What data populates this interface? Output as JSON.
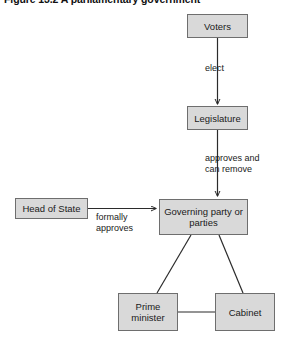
{
  "figure": {
    "title": "Figure 13.2  A parliamentary government",
    "nodes": {
      "voters": "Voters",
      "legislature": "Legislature",
      "head_of_state": "Head of State",
      "governing_party": "Governing party\nor parties",
      "prime_minister": "Prime\nminister",
      "cabinet": "Cabinet"
    },
    "edge_labels": {
      "elect": "elect",
      "approves_and_can_remove": "approves and\ncan remove",
      "formally_approves": "formally\napproves"
    },
    "colors": {
      "box_fill": "#d9d9d9",
      "box_border": "#6e6e6e",
      "connector": "#2b2b2b",
      "text": "#1a1a1a",
      "background": "#ffffff"
    }
  }
}
